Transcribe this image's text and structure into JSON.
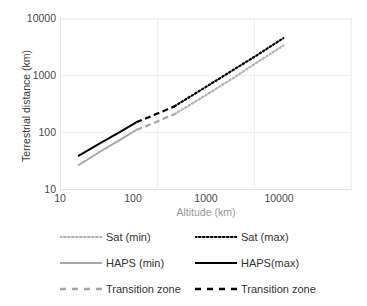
{
  "chart_data": {
    "type": "line",
    "title": "",
    "xlabel": "Altitude (km)",
    "ylabel": "Terrestrial distance (km)",
    "xscale": "log",
    "yscale": "log",
    "xlim": [
      10,
      10000
    ],
    "ylim": [
      10,
      10000
    ],
    "xticks": [
      "10",
      "100",
      "1000",
      "10000"
    ],
    "yticks": [
      "10",
      "100",
      "1000",
      "10000"
    ],
    "grid": true,
    "legend_position": "below",
    "series": [
      {
        "name": "Sat (min)",
        "style": "dotted",
        "color": "#b3b3b3",
        "x": [
          150,
          300,
          600,
          1000,
          2000
        ],
        "y": [
          210,
          430,
          900,
          1600,
          3400
        ]
      },
      {
        "name": "Sat (max)",
        "style": "dotted",
        "color": "#000000",
        "x": [
          150,
          300,
          600,
          1000,
          2000
        ],
        "y": [
          290,
          600,
          1250,
          2150,
          4600
        ]
      },
      {
        "name": "HAPS (min)",
        "style": "solid",
        "color": "#a6a6a6",
        "x": [
          15,
          25,
          40,
          60
        ],
        "y": [
          26,
          45,
          72,
          110
        ]
      },
      {
        "name": "HAPS(max)",
        "style": "solid",
        "color": "#000000",
        "x": [
          15,
          25,
          40,
          60
        ],
        "y": [
          38,
          63,
          100,
          150
        ]
      },
      {
        "name": "Transition zone",
        "style": "dashed",
        "color": "#a6a6a6",
        "x": [
          60,
          90,
          120,
          150
        ],
        "y": [
          110,
          145,
          180,
          210
        ]
      },
      {
        "name": "Transition zone",
        "style": "dashed",
        "color": "#000000",
        "x": [
          60,
          90,
          120,
          150
        ],
        "y": [
          150,
          200,
          245,
          290
        ]
      }
    ]
  },
  "legend": {
    "rows": [
      [
        {
          "label": "Sat (min)",
          "style": "dotted",
          "color": "#b3b3b3"
        },
        {
          "label": "Sat (max)",
          "style": "dotted",
          "color": "#000000"
        }
      ],
      [
        {
          "label": "HAPS (min)",
          "style": "solid",
          "color": "#a6a6a6"
        },
        {
          "label": "HAPS(max)",
          "style": "solid",
          "color": "#000000"
        }
      ],
      [
        {
          "label": "Transition zone",
          "style": "dashed",
          "color": "#a6a6a6"
        },
        {
          "label": "Transition zone",
          "style": "dashed",
          "color": "#000000"
        }
      ]
    ]
  },
  "colors": {
    "grid": "#efefef",
    "axis": "#e6e6e6",
    "tick_text": "#4a4a4a",
    "xlabel_text": "#9a9a9a",
    "ylabel_text": "#3a3a3a",
    "background": "#ffffff"
  }
}
